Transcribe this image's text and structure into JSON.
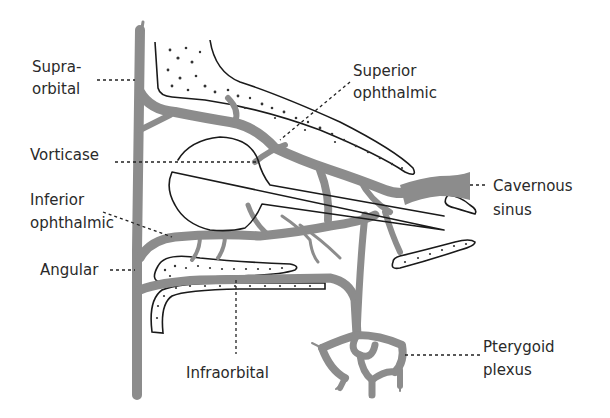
{
  "diagram": {
    "colors": {
      "vein": "#8c8c8c",
      "outline": "#1a1a1a",
      "label_text": "#2a2a2a",
      "background": "#ffffff"
    },
    "labels": {
      "supraorbital": {
        "line1": "Supra-",
        "line2": "orbital"
      },
      "superior_ophthalmic": {
        "line1": "Superior",
        "line2": "ophthalmic"
      },
      "vorticose": {
        "line1": "Vorticase"
      },
      "inferior_ophthalmic": {
        "line1": "Inferior",
        "line2": "ophthalmic"
      },
      "angular": {
        "line1": "Angular"
      },
      "cavernous_sinus": {
        "line1": "Cavernous",
        "line2": "sinus"
      },
      "infraorbital": {
        "line1": "Infraorbital"
      },
      "pterygoid_plexus": {
        "line1": "Pterygoid",
        "line2": "plexus"
      }
    }
  }
}
